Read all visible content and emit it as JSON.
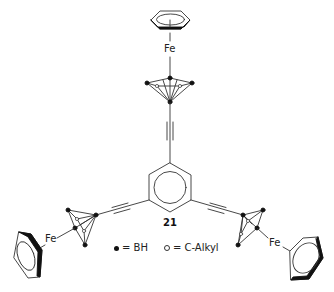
{
  "figure": {
    "compound_number": "21",
    "metal_labels": {
      "top": "Fe",
      "left": "Fe",
      "right": "Fe"
    },
    "legend": {
      "filled_circle": {
        "symbol": "filled-circle",
        "text": "= BH"
      },
      "open_circle": {
        "symbol": "open-circle",
        "text": "= C-Alkyl"
      }
    },
    "colors": {
      "line": "#333333",
      "fill": "#111111",
      "background": "#ffffff"
    }
  }
}
